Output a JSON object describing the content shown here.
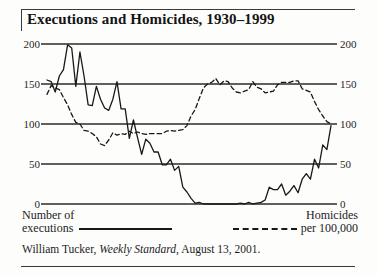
{
  "figure": {
    "title": "Executions and Homicides, 1930–1999",
    "source_prefix": "William Tucker, ",
    "source_italic": "Weekly Standard",
    "source_suffix": ", August 13, 2001."
  },
  "legend": {
    "series1_line1": "Number of",
    "series1_line2": "executions",
    "series2_line1": "Homicides",
    "series2_line2": "per 100,000"
  },
  "axis": {
    "left_ticks": [
      "200",
      "150",
      "100",
      "50",
      "0"
    ],
    "right_ticks": [
      "200",
      "150",
      "100",
      "50",
      "0"
    ]
  },
  "colors": {
    "line": "#181818",
    "grid": "#2b2b2b",
    "text": "#1c1c1c",
    "background": "#fdfdfc"
  },
  "chart_data": {
    "type": "line",
    "title": "Executions and Homicides, 1930–1999",
    "xlabel": "",
    "ylabel": "",
    "ylim": [
      0,
      200
    ],
    "yticks": [
      0,
      50,
      100,
      150,
      200
    ],
    "xlim": [
      1930,
      1999
    ],
    "grid": true,
    "legend_position": "bottom",
    "x": [
      1930,
      1931,
      1932,
      1933,
      1934,
      1935,
      1936,
      1937,
      1938,
      1939,
      1940,
      1941,
      1942,
      1943,
      1944,
      1945,
      1946,
      1947,
      1948,
      1949,
      1950,
      1951,
      1952,
      1953,
      1954,
      1955,
      1956,
      1957,
      1958,
      1959,
      1960,
      1961,
      1962,
      1963,
      1964,
      1965,
      1966,
      1967,
      1968,
      1969,
      1970,
      1971,
      1972,
      1973,
      1974,
      1975,
      1976,
      1977,
      1978,
      1979,
      1980,
      1981,
      1982,
      1983,
      1984,
      1985,
      1986,
      1987,
      1988,
      1989,
      1990,
      1991,
      1992,
      1993,
      1994,
      1995,
      1996,
      1997,
      1998,
      1999
    ],
    "series": [
      {
        "name": "Number of executions",
        "style": "solid",
        "axis": "left",
        "values": [
          155,
          153,
          140,
          160,
          168,
          199,
          195,
          147,
          190,
          160,
          124,
          123,
          147,
          131,
          120,
          117,
          131,
          153,
          119,
          119,
          82,
          105,
          83,
          62,
          81,
          76,
          65,
          65,
          49,
          49,
          56,
          42,
          47,
          21,
          15,
          7,
          1,
          2,
          0,
          0,
          0,
          0,
          0,
          0,
          0,
          0,
          0,
          1,
          0,
          2,
          0,
          1,
          2,
          5,
          21,
          18,
          18,
          25,
          11,
          16,
          23,
          14,
          31,
          38,
          31,
          56,
          45,
          74,
          68,
          98
        ]
      },
      {
        "name": "Homicides per 100,000",
        "style": "dashed",
        "axis": "right",
        "scale_note": "plotted on same 0-200 frame; values shown are index scaled ×20",
        "values": [
          137,
          148,
          145,
          143,
          133,
          124,
          112,
          102,
          100,
          92,
          91,
          88,
          84,
          75,
          73,
          80,
          89,
          86,
          88,
          87,
          91,
          88,
          90,
          88,
          87,
          88,
          88,
          88,
          88,
          91,
          92,
          91,
          92,
          93,
          98,
          110,
          118,
          132,
          145,
          150,
          152,
          157,
          149,
          154,
          153,
          145,
          140,
          139,
          141,
          143,
          153,
          146,
          144,
          139,
          140,
          141,
          149,
          152,
          152,
          152,
          154,
          154,
          144,
          142,
          140,
          128,
          118,
          110,
          103,
          100
        ]
      }
    ]
  }
}
